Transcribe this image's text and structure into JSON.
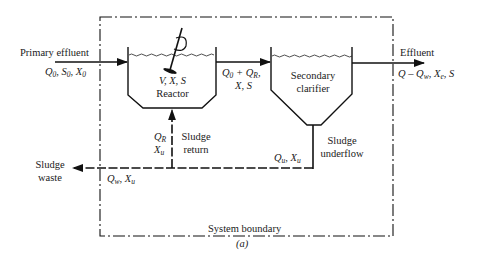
{
  "figure": {
    "caption": "(a)",
    "boundary_label": "System boundary"
  },
  "inflow": {
    "title": "Primary effluent",
    "vars": [
      {
        "sym": "Q",
        "sub": "0"
      },
      {
        "sym": "S",
        "sub": "0"
      },
      {
        "sym": "X",
        "sub": "0"
      }
    ]
  },
  "reactor": {
    "vars": "V, X, S",
    "name": "Reactor"
  },
  "reactor_to_clarifier": {
    "line1_a": "Q",
    "line1_a_sub": "0",
    "line1_plus": " + ",
    "line1_b": "Q",
    "line1_b_sub": "R",
    "line1_tail": ",",
    "line2": "X, S"
  },
  "clarifier": {
    "line1": "Secondary",
    "line2": "clarifier"
  },
  "effluent": {
    "title": "Effluent",
    "expr_q": "Q",
    "expr_minus": " – ",
    "expr_qw": "Q",
    "expr_qw_sub": "w",
    "expr_sep1": ", ",
    "expr_xe": "X",
    "expr_xe_sub": "e",
    "expr_tail": ", S"
  },
  "sludge_return": {
    "q": "Q",
    "q_sub": "R",
    "x": "X",
    "x_sub": "u",
    "label1": "Sludge",
    "label2": "return"
  },
  "sludge_underflow": {
    "q": "Q",
    "q_sub": "u",
    "x": "X",
    "x_sub": "u",
    "sep": ", ",
    "label1": "Sludge",
    "label2": "underflow"
  },
  "sludge_waste": {
    "label1": "Sludge",
    "label2": "waste",
    "q": "Q",
    "q_sub": "w",
    "x": "X",
    "x_sub": "u",
    "sep": ", "
  },
  "colors": {
    "line": "#111111",
    "background": "#ffffff"
  }
}
